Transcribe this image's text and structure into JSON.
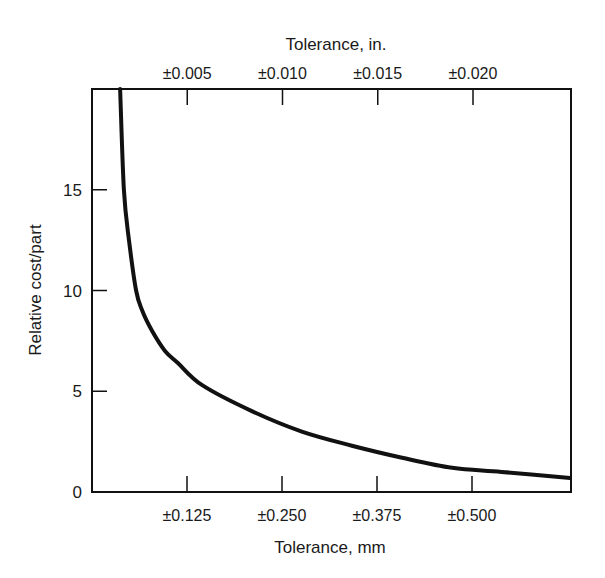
{
  "chart_data": {
    "type": "line",
    "title": "",
    "xlabel": "Tolerance, mm",
    "ylabel": "Relative cost/part",
    "x2label": "Tolerance, in.",
    "xlim": [
      0,
      0.63
    ],
    "ylim": [
      0,
      20
    ],
    "grid": false,
    "legend": null,
    "x_ticks": [
      {
        "value": 0.125,
        "label": "±0.125"
      },
      {
        "value": 0.25,
        "label": "±0.250"
      },
      {
        "value": 0.375,
        "label": "±0.375"
      },
      {
        "value": 0.5,
        "label": "±0.500"
      }
    ],
    "x2_ticks": [
      {
        "value": 0.005,
        "label": "±0.005"
      },
      {
        "value": 0.01,
        "label": "±0.010"
      },
      {
        "value": 0.015,
        "label": "±0.015"
      },
      {
        "value": 0.02,
        "label": "±0.020"
      }
    ],
    "y_ticks": [
      {
        "value": 0,
        "label": "0"
      },
      {
        "value": 5,
        "label": "5"
      },
      {
        "value": 10,
        "label": "10"
      },
      {
        "value": 15,
        "label": "15"
      }
    ],
    "series": [
      {
        "name": "Relative cost vs tolerance",
        "color": "#111111",
        "x": [
          0.037,
          0.042,
          0.049,
          0.058,
          0.066,
          0.079,
          0.096,
          0.113,
          0.145,
          0.211,
          0.276,
          0.342,
          0.408,
          0.474,
          0.539,
          0.629
        ],
        "y": [
          20.0,
          15.0,
          12.4,
          10.0,
          9.0,
          8.0,
          7.0,
          6.4,
          5.3,
          4.0,
          3.0,
          2.3,
          1.7,
          1.2,
          1.0,
          0.7
        ]
      }
    ]
  },
  "layout": {
    "plot_px": {
      "left": 92,
      "top": 89,
      "right": 571,
      "bottom": 492
    },
    "px_per_mm": 760,
    "px_per_in": 19050
  }
}
